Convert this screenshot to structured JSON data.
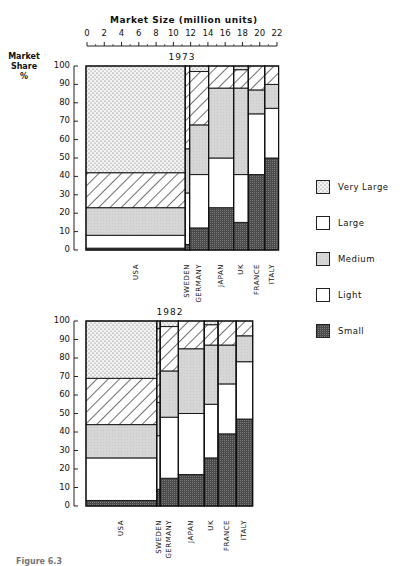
{
  "top_axis": {
    "title": "Market Size (million units)",
    "ticks": [
      "0",
      "2",
      "4",
      "6",
      "8",
      "10",
      "12",
      "14",
      "16",
      "18",
      "20",
      "22"
    ]
  },
  "y_axis": {
    "title_line1": "Market",
    "title_line2": "Share",
    "title_line3": "%",
    "ticks": [
      "100",
      "90",
      "80",
      "70",
      "60",
      "50",
      "40",
      "30",
      "20",
      "10",
      "0"
    ]
  },
  "legend": {
    "items": [
      {
        "label": "Very Large",
        "pattern": "dots"
      },
      {
        "label": "Large",
        "pattern": "hatch"
      },
      {
        "label": "Medium",
        "pattern": "gray"
      },
      {
        "label": "Light",
        "pattern": "white"
      },
      {
        "label": "Small",
        "pattern": "dark"
      }
    ]
  },
  "caption": "Figure 6.3",
  "colors": {
    "very_large": "#efefef",
    "large": "#ffffff",
    "medium": "#d4d4d4",
    "light": "#ffffff",
    "small": "#5a5a5a",
    "outline": "#1a1a1a"
  },
  "chart_data": [
    {
      "type": "bar",
      "subtype": "marimekko (variable-width 100% stacked)",
      "title": "1973",
      "xlabel": "Market Size (million units)",
      "ylabel": "Market Share %",
      "xlim": [
        0,
        22
      ],
      "ylim": [
        0,
        100
      ],
      "categories": [
        "USA",
        "SWEDEN",
        "GERMANY",
        "JAPAN",
        "UK",
        "FRANCE",
        "ITALY"
      ],
      "widths": [
        11.5,
        0.5,
        2.2,
        2.9,
        1.7,
        1.9,
        1.6
      ],
      "series": [
        {
          "name": "Small",
          "values": [
            1,
            3,
            12,
            23,
            15,
            41,
            50
          ]
        },
        {
          "name": "Light",
          "values": [
            7,
            28,
            29,
            27,
            26,
            33,
            27
          ]
        },
        {
          "name": "Medium",
          "values": [
            15,
            24,
            27,
            38,
            47,
            13,
            13
          ]
        },
        {
          "name": "Large",
          "values": [
            19,
            45,
            29,
            12,
            10,
            13,
            10
          ]
        },
        {
          "name": "Very Large",
          "values": [
            58,
            0,
            3,
            0,
            2,
            0,
            0
          ]
        }
      ]
    },
    {
      "type": "bar",
      "subtype": "marimekko (variable-width 100% stacked)",
      "title": "1982",
      "xlabel": "Market Size (million units)",
      "ylabel": "Market Share %",
      "xlim": [
        0,
        22
      ],
      "ylim": [
        0,
        100
      ],
      "categories": [
        "USA",
        "SWEDEN",
        "GERMANY",
        "JAPAN",
        "UK",
        "FRANCE",
        "ITALY"
      ],
      "widths": [
        8.2,
        0.4,
        2.1,
        3.0,
        1.6,
        2.1,
        1.9
      ],
      "series": [
        {
          "name": "Small",
          "values": [
            3,
            9,
            15,
            17,
            26,
            39,
            47
          ]
        },
        {
          "name": "Light",
          "values": [
            23,
            29,
            33,
            33,
            29,
            27,
            31
          ]
        },
        {
          "name": "Medium",
          "values": [
            18,
            18,
            25,
            35,
            32,
            21,
            14
          ]
        },
        {
          "name": "Large",
          "values": [
            25,
            40,
            24,
            15,
            11,
            13,
            8
          ]
        },
        {
          "name": "Very Large",
          "values": [
            31,
            4,
            3,
            0,
            2,
            0,
            0
          ]
        }
      ]
    }
  ]
}
